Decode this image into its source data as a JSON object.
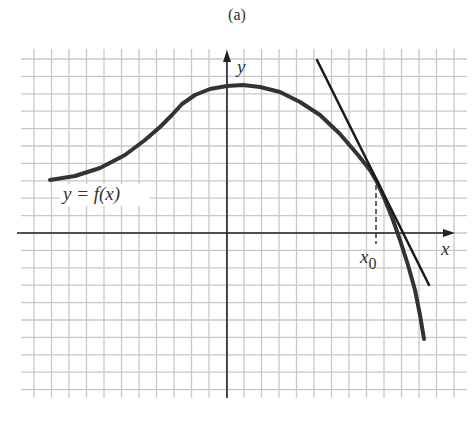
{
  "caption": "(a)",
  "labels": {
    "y_axis": "y",
    "x_axis": "x",
    "function": "y = f(x)",
    "x0_main": "x",
    "x0_sub": "0"
  },
  "colors": {
    "grid": "#c8c8c8",
    "axis": "#222222",
    "curve": "#333333",
    "tangent": "#1a1a1a"
  },
  "diagram": {
    "type": "function-graph-with-tangent",
    "grid": {
      "x_start": 34,
      "x_step": 17.5,
      "x_count": 25,
      "y_start": 59,
      "y_step": 17.4,
      "y_count": 20,
      "left": 21,
      "right": 467,
      "top": 49,
      "bottom": 398
    },
    "axes": {
      "x_axis_y": 233,
      "x_axis_from": 17,
      "x_axis_to": 455,
      "y_axis_x": 227,
      "y_axis_from": 398,
      "y_axis_to": 50
    },
    "curve_points": [
      [
        50,
        180
      ],
      [
        75,
        176
      ],
      [
        100,
        168
      ],
      [
        125,
        155
      ],
      [
        145,
        140
      ],
      [
        160,
        127
      ],
      [
        172,
        115
      ],
      [
        182,
        104
      ],
      [
        195,
        95
      ],
      [
        210,
        89
      ],
      [
        227,
        86
      ],
      [
        243,
        85
      ],
      [
        260,
        87
      ],
      [
        280,
        92
      ],
      [
        300,
        102
      ],
      [
        320,
        115
      ],
      [
        340,
        134
      ],
      [
        358,
        155
      ],
      [
        370,
        170
      ],
      [
        377,
        182
      ],
      [
        385,
        200
      ],
      [
        393,
        220
      ],
      [
        400,
        240
      ],
      [
        408,
        265
      ],
      [
        415,
        290
      ],
      [
        420,
        315
      ],
      [
        424,
        339
      ]
    ],
    "tangent_line": {
      "from": [
        317,
        60
      ],
      "to": [
        429,
        285
      ]
    },
    "tangent_point": [
      376,
      182
    ],
    "dashed_drop": {
      "from": [
        376,
        185
      ],
      "to": [
        376,
        244
      ]
    }
  }
}
